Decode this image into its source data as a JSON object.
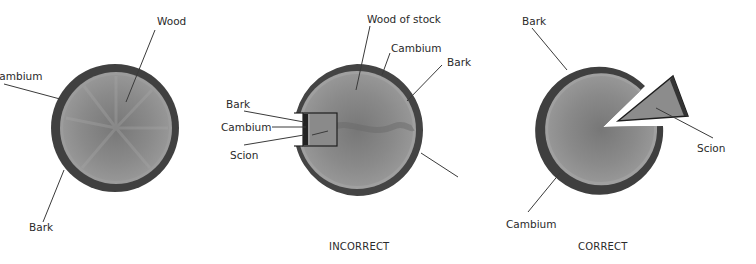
{
  "figure": {
    "panels": [
      {
        "id": "stock-cross-section",
        "caption": "",
        "labels": {
          "wood": "Wood",
          "cambium": "Cambium",
          "bark": "Bark"
        }
      },
      {
        "id": "incorrect-graft",
        "caption": "INCORRECT",
        "labels": {
          "wood_of_stock": "Wood of stock",
          "cambium_stock": "Cambium",
          "bark_stock": "Bark",
          "bark_scion": "Bark",
          "cambium_scion": "Cambium",
          "scion": "Scion"
        }
      },
      {
        "id": "correct-graft",
        "caption": "CORRECT",
        "labels": {
          "bark": "Bark",
          "scion": "Scion",
          "cambium": "Cambium"
        }
      }
    ],
    "colors": {
      "bark": "#3e3e3e",
      "cambium_ring": "#8e8e8e",
      "wood": "#8a8a8a",
      "wood_dark": "#6f6f6f",
      "background": "#ffffff"
    }
  }
}
